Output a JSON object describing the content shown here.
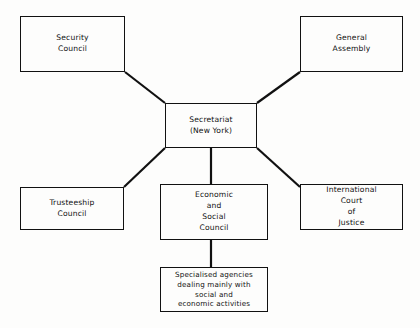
{
  "diagram": {
    "type": "org-chart",
    "background_color": "#fdfdfc",
    "line_color": "#111111",
    "text_color": "#111111",
    "nodes": [
      {
        "id": "security-council",
        "label": "Security\nCouncil",
        "x": 20,
        "y": 16,
        "w": 105,
        "h": 56
      },
      {
        "id": "general-assembly",
        "label": "General\nAssembly",
        "x": 300,
        "y": 16,
        "w": 103,
        "h": 56
      },
      {
        "id": "secretariat",
        "label": "Secretariat\n(New York)",
        "x": 165,
        "y": 103,
        "w": 92,
        "h": 45
      },
      {
        "id": "trusteeship-council",
        "label": "Trusteeship\nCouncil",
        "x": 20,
        "y": 187,
        "w": 104,
        "h": 43
      },
      {
        "id": "economic-and-social-council",
        "label": "Economic\nand\nSocial\nCouncil",
        "x": 160,
        "y": 184,
        "w": 108,
        "h": 56
      },
      {
        "id": "international-court-of-justice",
        "label": "International\nCourt\nof\nJustice",
        "x": 300,
        "y": 184,
        "w": 103,
        "h": 46
      },
      {
        "id": "specialised-agencies",
        "label": "Specialised agencies\ndealing mainly with\nsocial and\neconomic activities",
        "x": 160,
        "y": 267,
        "w": 108,
        "h": 45
      }
    ],
    "edges": [
      {
        "id": "security-council-to-secretariat",
        "from": "security-council",
        "to": "secretariat",
        "points": "125,72 165,103"
      },
      {
        "id": "general-assembly-to-secretariat",
        "from": "general-assembly",
        "to": "secretariat",
        "points": "300,72 257,103"
      },
      {
        "id": "secretariat-to-trusteeship-council",
        "from": "secretariat",
        "to": "trusteeship-council",
        "points": "165,148 124,187"
      },
      {
        "id": "secretariat-to-international-court",
        "from": "secretariat",
        "to": "international-court-of-justice",
        "points": "257,148 300,187"
      },
      {
        "id": "secretariat-to-economic-and-social-council",
        "from": "secretariat",
        "to": "economic-and-social-council",
        "points": "211,148 211,184"
      },
      {
        "id": "economic-and-social-council-to-specialised-agencies",
        "from": "economic-and-social-council",
        "to": "specialised-agencies",
        "points": "211,240 211,267"
      }
    ]
  }
}
